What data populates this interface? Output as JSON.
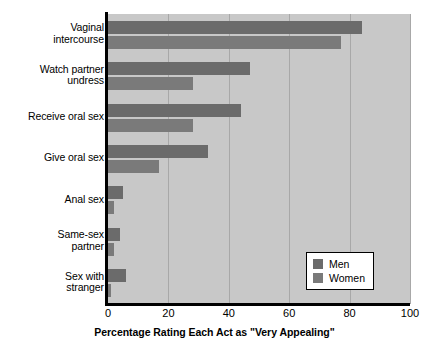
{
  "chart_data": {
    "type": "bar",
    "orientation": "horizontal",
    "title": "",
    "xlabel": "Percentage Rating Each Act as \"Very Appealing\"",
    "ylabel": "",
    "xlim": [
      0,
      100
    ],
    "xticks": [
      0,
      20,
      40,
      60,
      80,
      100
    ],
    "grid": true,
    "legend_position": "bottom-right",
    "categories": [
      "Vaginal intercourse",
      "Watch partner undress",
      "Receive oral sex",
      "Give oral sex",
      "Anal sex",
      "Same-sex partner",
      "Sex with stranger"
    ],
    "series": [
      {
        "name": "Men",
        "color": "#6b6b6b",
        "values": [
          84,
          47,
          44,
          33,
          5,
          4,
          6
        ]
      },
      {
        "name": "Women",
        "color": "#7a7a7a",
        "values": [
          77,
          28,
          28,
          17,
          2,
          2,
          1
        ]
      }
    ]
  },
  "categories_display": [
    {
      "lines": [
        "Vaginal",
        "intercourse"
      ]
    },
    {
      "lines": [
        "Watch partner",
        "undress"
      ]
    },
    {
      "lines": [
        "Receive oral sex"
      ]
    },
    {
      "lines": [
        "Give oral sex"
      ]
    },
    {
      "lines": [
        "Anal sex"
      ]
    },
    {
      "lines": [
        "Same-sex",
        "partner"
      ]
    },
    {
      "lines": [
        "Sex with",
        "stranger"
      ]
    }
  ],
  "axis": {
    "tick_labels": [
      "0",
      "20",
      "40",
      "60",
      "80",
      "100"
    ],
    "title": "Percentage Rating Each Act as \"Very Appealing\""
  },
  "legend": {
    "items": [
      {
        "label": "Men",
        "color": "#6b6b6b"
      },
      {
        "label": "Women",
        "color": "#7a7a7a"
      }
    ]
  },
  "colors": {
    "plot_background": "#c8c8c8",
    "page_background": "#ffffff",
    "axis": "#000000",
    "gridline": "#a8a8a8",
    "men": "#6b6b6b",
    "women": "#7a7a7a"
  }
}
